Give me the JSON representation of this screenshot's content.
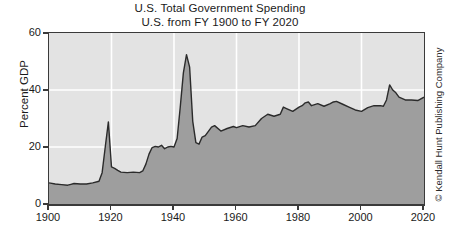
{
  "chart_data": {
    "type": "area",
    "title": "U.S. Total Government Spending",
    "subtitle": "U.S. from FY 1900 to FY 2020",
    "xlabel": "",
    "ylabel": "Percent GDP",
    "xlim": [
      1900,
      2020
    ],
    "ylim": [
      0,
      60
    ],
    "xticks": [
      "1900",
      "1920",
      "1940",
      "1960",
      "1980",
      "2000",
      "2020"
    ],
    "xtick_values": [
      1900,
      1920,
      1940,
      1960,
      1980,
      2000,
      2020
    ],
    "yticks": [
      "0",
      "20",
      "40",
      "60"
    ],
    "ytick_values": [
      0,
      20,
      40,
      60
    ],
    "grid": true,
    "grid_color": "#ffffff",
    "legend": null,
    "plot_background": "#e3e3e3",
    "area_fill_color": "#9e9e9e",
    "line_color": "#2b2b2b",
    "series": [
      {
        "name": "Total government spending",
        "x": [
          1900,
          1902,
          1904,
          1906,
          1907,
          1908,
          1910,
          1912,
          1914,
          1916,
          1917,
          1918,
          1919,
          1920,
          1921,
          1922,
          1923,
          1925,
          1927,
          1929,
          1930,
          1931,
          1932,
          1933,
          1934,
          1935,
          1936,
          1937,
          1938,
          1939,
          1940,
          1941,
          1942,
          1943,
          1944,
          1945,
          1946,
          1947,
          1948,
          1949,
          1950,
          1952,
          1953,
          1955,
          1957,
          1959,
          1960,
          1962,
          1964,
          1966,
          1968,
          1970,
          1972,
          1974,
          1975,
          1976,
          1978,
          1980,
          1981,
          1982,
          1983,
          1984,
          1986,
          1988,
          1990,
          1991,
          1992,
          1994,
          1996,
          1998,
          2000,
          2002,
          2004,
          2006,
          2007,
          2008,
          2009,
          2010,
          2011,
          2012,
          2014,
          2016,
          2018,
          2020
        ],
        "values": [
          7.4,
          7.0,
          6.8,
          6.6,
          6.9,
          7.2,
          7.0,
          7.0,
          7.4,
          8.0,
          11.0,
          20.0,
          28.8,
          13.0,
          12.5,
          11.8,
          11.2,
          11.0,
          11.2,
          11.0,
          11.6,
          14.0,
          17.5,
          19.8,
          20.2,
          20.0,
          20.6,
          19.4,
          20.0,
          20.2,
          20.0,
          23.0,
          34.0,
          46.0,
          52.4,
          48.0,
          29.0,
          21.5,
          21.0,
          23.5,
          24.0,
          27.0,
          27.5,
          25.6,
          26.5,
          27.2,
          26.8,
          27.5,
          27.0,
          27.5,
          30.0,
          31.5,
          30.8,
          31.5,
          34.0,
          33.5,
          32.5,
          34.0,
          34.5,
          35.5,
          35.8,
          34.5,
          35.2,
          34.3,
          35.2,
          35.8,
          36.0,
          35.0,
          34.0,
          33.0,
          32.5,
          33.8,
          34.5,
          34.5,
          34.3,
          36.5,
          41.8,
          40.0,
          39.0,
          37.5,
          36.5,
          36.5,
          36.3,
          37.5
        ]
      }
    ]
  },
  "credit": {
    "text": "© Kendall Hunt Publishing Company"
  }
}
